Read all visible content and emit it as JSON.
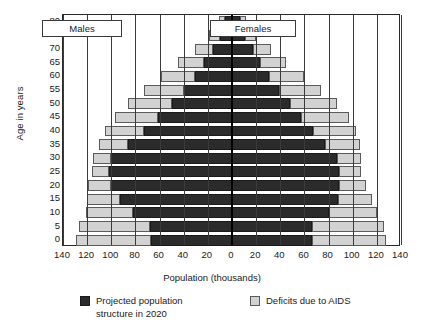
{
  "chart_data": {
    "type": "bar",
    "subtype": "population-pyramid",
    "title": "",
    "xlabel": "Population (thousands)",
    "ylabel": "Age in years",
    "xlim": [
      -140,
      140
    ],
    "xticks": [
      140,
      120,
      100,
      80,
      60,
      40,
      20,
      0,
      20,
      40,
      60,
      80,
      100,
      120,
      140
    ],
    "gridlines": true,
    "legend_position": "bottom",
    "categories": [
      "0",
      "5",
      "10",
      "15",
      "20",
      "25",
      "30",
      "35",
      "40",
      "45",
      "50",
      "55",
      "60",
      "65",
      "70",
      "75",
      "80"
    ],
    "side_labels": {
      "left": "Males",
      "right": "Females"
    },
    "series": [
      {
        "name": "Projected population structure in 2020",
        "color": "#2b2b2b",
        "males": [
          67,
          68,
          82,
          93,
          100,
          102,
          100,
          86,
          73,
          61,
          50,
          40,
          31,
          23,
          16,
          10,
          6
        ],
        "females": [
          66,
          66,
          80,
          88,
          89,
          89,
          87,
          77,
          67,
          57,
          48,
          39,
          31,
          23,
          17,
          11,
          7
        ]
      },
      {
        "name": "Deficits due to AIDS",
        "color": "#d2d2d2",
        "males": [
          62,
          59,
          39,
          27,
          19,
          14,
          15,
          24,
          32,
          36,
          36,
          33,
          28,
          22,
          15,
          9,
          5
        ],
        "females": [
          62,
          60,
          40,
          28,
          22,
          18,
          20,
          29,
          36,
          40,
          39,
          35,
          29,
          22,
          15,
          9,
          5
        ]
      }
    ]
  },
  "axes": {
    "y_title": "Age in years",
    "x_title": "Population (thousands)"
  },
  "labels": {
    "males": "Males",
    "females": "Females"
  },
  "legend": {
    "projected": "Projected population\nstructure in 2020",
    "deficits": "Deficits due to AIDS"
  }
}
